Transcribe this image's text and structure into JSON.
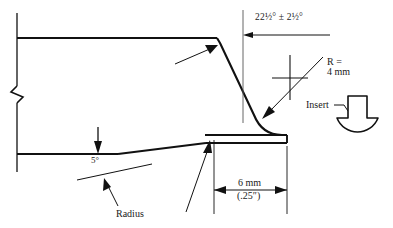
{
  "drawing": {
    "title": "Weld joint profile with insert",
    "background_color": "#ffffff",
    "line_color": "#111111",
    "annotations": {
      "angle": "22½° ± 2½°",
      "radius_label_line1": "R =",
      "radius_label_line2": "4 mm",
      "insert": "Insert",
      "taper_angle": "5°",
      "dimension_metric": "6 mm",
      "dimension_imperial": "(.25″)",
      "radius_leader": "Radius"
    },
    "features": [
      {
        "name": "break-symbol",
        "description": "zigzag break on left vertical edge"
      },
      {
        "name": "bevel-face",
        "description": "angled bevel face from top edge"
      },
      {
        "name": "fillet",
        "description": "4 mm root fillet radius"
      },
      {
        "name": "land",
        "description": "6 mm root land"
      },
      {
        "name": "taper",
        "description": "5 degree taper on lower face"
      },
      {
        "name": "insert-part",
        "description": "mushroom shaped consumable insert"
      }
    ]
  }
}
